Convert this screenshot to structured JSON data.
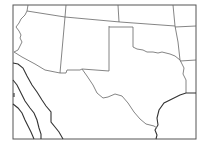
{
  "map": {
    "type": "outline-map",
    "region": "Southwestern United States",
    "background_color": "#ffffff",
    "line_color": "#555555",
    "labels": []
  }
}
